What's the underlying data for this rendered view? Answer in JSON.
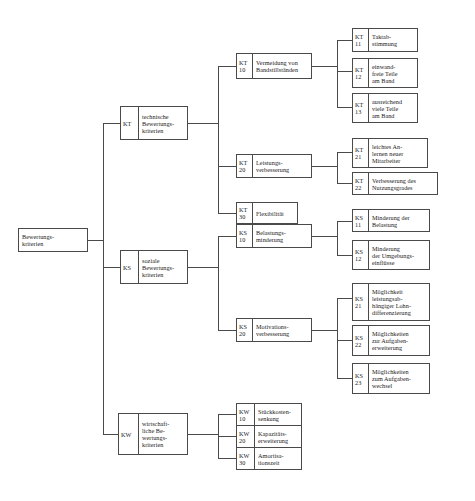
{
  "diagram": {
    "type": "tree",
    "line_color": "#4a4a4a",
    "box_fill": "#ffffff",
    "text_color": "#1a1a1a"
  },
  "nodes": {
    "root": {
      "code": [],
      "label": [
        "Bewertungs-",
        "kriterien"
      ]
    },
    "kt": {
      "code": [
        "KT"
      ],
      "label": [
        "technische",
        "Bewertungs-",
        "kriterien"
      ]
    },
    "ks": {
      "code": [
        "KS"
      ],
      "label": [
        "soziale",
        "Bewertungs-",
        "kriterien"
      ]
    },
    "kw": {
      "code": [
        "KW"
      ],
      "label": [
        "wirtschaft-",
        "liche Be-",
        "wertungs-",
        "kriterien"
      ]
    },
    "kt10": {
      "code": [
        "KT",
        "10"
      ],
      "label": [
        "Vermeidung von",
        "Bandstillständen"
      ]
    },
    "kt11": {
      "code": [
        "KT",
        "11"
      ],
      "label": [
        "Taktab-",
        "stimmung"
      ]
    },
    "kt12": {
      "code": [
        "KT",
        "12"
      ],
      "label": [
        "einwand-",
        "freie Teile",
        "am Band"
      ]
    },
    "kt13": {
      "code": [
        "KT",
        "13"
      ],
      "label": [
        "ausreichend",
        "viele Teile",
        "am Band"
      ]
    },
    "kt20": {
      "code": [
        "KT",
        "20"
      ],
      "label": [
        "Leistungs-",
        "verbesserung"
      ]
    },
    "kt21": {
      "code": [
        "KT",
        "21"
      ],
      "label": [
        "leichtes An-",
        "lernen neuer",
        "Mitarbeiter"
      ]
    },
    "kt22": {
      "code": [
        "KT",
        "22"
      ],
      "label": [
        "Verbesserung des",
        "Nutzungsgrades"
      ]
    },
    "kt30": {
      "code": [
        "KT",
        "30"
      ],
      "label": [
        "Flexibilität"
      ]
    },
    "ks10": {
      "code": [
        "KS",
        "10"
      ],
      "label": [
        "Belastungs-",
        "minderung"
      ]
    },
    "ks11": {
      "code": [
        "KS",
        "11"
      ],
      "label": [
        "Minderung der",
        "Belastung"
      ]
    },
    "ks12": {
      "code": [
        "KS",
        "12"
      ],
      "label": [
        "Minderung",
        "der Umgebungs-",
        "einflüsse"
      ]
    },
    "ks20": {
      "code": [
        "KS",
        "20"
      ],
      "label": [
        "Motivations-",
        "verbesserung"
      ]
    },
    "ks21": {
      "code": [
        "KS",
        "21"
      ],
      "label": [
        "Möglichkeit",
        "leistungsab-",
        "hängiger Lohn-",
        "differenzierung"
      ]
    },
    "ks22": {
      "code": [
        "KS",
        "22"
      ],
      "label": [
        "Möglichkeiten",
        "zur Aufgaben-",
        "erweiterung"
      ]
    },
    "ks23": {
      "code": [
        "KS",
        "23"
      ],
      "label": [
        "Möglichkeiten",
        "zum Aufgaben-",
        "wechsel"
      ]
    },
    "kw10": {
      "code": [
        "KW",
        "10"
      ],
      "label": [
        "Stückkosten-",
        "senkung"
      ]
    },
    "kw20": {
      "code": [
        "KW",
        "20"
      ],
      "label": [
        "Kapazitäts-",
        "erweiterung"
      ]
    },
    "kw30": {
      "code": [
        "KW",
        "30"
      ],
      "label": [
        "Amortisa-",
        "tionszeit"
      ]
    }
  }
}
